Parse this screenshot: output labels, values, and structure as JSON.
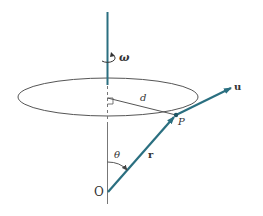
{
  "diagram": {
    "labels": {
      "omega": "ω",
      "d": "d",
      "P": "P",
      "u": "u",
      "r": "r",
      "theta": "θ",
      "O": "O"
    },
    "colors": {
      "vector": "#2a6f80",
      "line": "#555555",
      "background": "#ffffff"
    }
  }
}
